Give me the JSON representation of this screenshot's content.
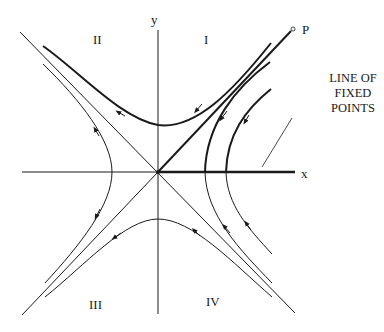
{
  "diagram": {
    "axes": {
      "x_label": "x",
      "y_label": "y"
    },
    "quadrants": {
      "q1": "I",
      "q2": "II",
      "q3": "III",
      "q4": "IV"
    },
    "point_label": "P",
    "annotation": {
      "line1": "LINE OF",
      "line2": "FIXED",
      "line3": "POINTS"
    },
    "colors": {
      "ink": "#1a1a1a",
      "background": "#ffffff"
    }
  }
}
